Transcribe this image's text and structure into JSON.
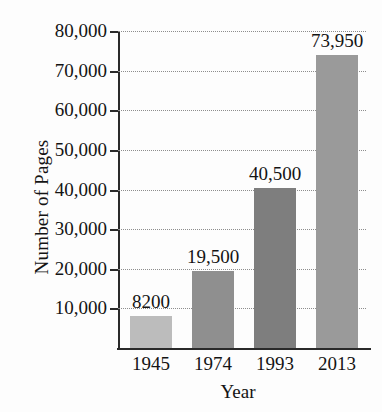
{
  "chart_data": {
    "type": "bar",
    "title": "",
    "xlabel": "Year",
    "ylabel": "Number of Pages",
    "categories": [
      "1945",
      "1974",
      "1993",
      "2013"
    ],
    "values": [
      8200,
      19500,
      40500,
      73950
    ],
    "value_labels": [
      "8200",
      "19,500",
      "40,500",
      "73,950"
    ],
    "bar_colors": [
      "#bcbcbc",
      "#8f8f8f",
      "#7e7e7e",
      "#9a9a9a"
    ],
    "ylim": [
      0,
      80000
    ],
    "ytick_values": [
      10000,
      20000,
      30000,
      40000,
      50000,
      60000,
      70000,
      80000
    ],
    "ytick_labels": [
      "10,000",
      "20,000",
      "30,000",
      "40,000",
      "50,000",
      "60,000",
      "70,000",
      "80,000"
    ],
    "grid": true,
    "grid_style": "dotted",
    "legend": "none",
    "axis_color": "#2a2a2a",
    "gridline_color": "#8d8d8d",
    "background_color": "#fdfdfd"
  }
}
